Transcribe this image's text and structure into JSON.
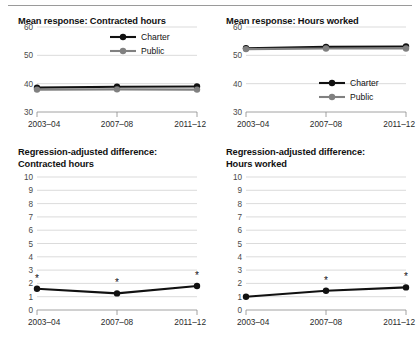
{
  "figure": {
    "background": "#ffffff",
    "charter_color": "#111111",
    "public_color": "#808080",
    "grid_color": "#d2d2d2",
    "axis_color": "#8c8c8c"
  },
  "legend": {
    "charter_label": "Charter",
    "public_label": "Public"
  },
  "panels": {
    "top_left": {
      "title": "Mean response: Contracted hours"
    },
    "top_right": {
      "title": "Mean response: Hours worked"
    },
    "bottom_left": {
      "title_line1": "Regression-adjusted difference:",
      "title_line2": "Contracted hours"
    },
    "bottom_right": {
      "title_line1": "Regression-adjusted difference:",
      "title_line2": "Hours worked"
    }
  },
  "chart_data": [
    {
      "id": "mean-response-contracted-hours",
      "type": "line",
      "title": "Mean response: Contracted hours",
      "xlabel": "",
      "ylabel": "",
      "categories": [
        "2003–04",
        "2007–08",
        "2011–12"
      ],
      "yticks": [
        30,
        40,
        50,
        60
      ],
      "ylim": [
        30,
        60
      ],
      "grid": true,
      "legend_position": "top-right",
      "series": [
        {
          "name": "Charter",
          "color": "#111111",
          "values": [
            38.6,
            38.9,
            39.0
          ]
        },
        {
          "name": "Public",
          "color": "#808080",
          "values": [
            37.9,
            38.0,
            37.9
          ]
        }
      ]
    },
    {
      "id": "mean-response-hours-worked",
      "type": "line",
      "title": "Mean response: Hours worked",
      "xlabel": "",
      "ylabel": "",
      "categories": [
        "2003–04",
        "2007–08",
        "2011–12"
      ],
      "yticks": [
        30,
        40,
        50,
        60
      ],
      "ylim": [
        30,
        60
      ],
      "grid": true,
      "legend_position": "bottom-right",
      "series": [
        {
          "name": "Charter",
          "color": "#111111",
          "values": [
            52.5,
            53.0,
            53.1
          ]
        },
        {
          "name": "Public",
          "color": "#808080",
          "values": [
            52.2,
            52.4,
            52.4
          ]
        }
      ]
    },
    {
      "id": "regression-adjusted-difference-contracted-hours",
      "type": "line",
      "title": "Regression-adjusted difference: Contracted hours",
      "xlabel": "",
      "ylabel": "",
      "categories": [
        "2003–04",
        "2007–08",
        "2011–12"
      ],
      "yticks": [
        0,
        1,
        2,
        3,
        4,
        5,
        6,
        7,
        8,
        9,
        10
      ],
      "ylim": [
        0,
        10
      ],
      "grid": true,
      "legend_position": "none",
      "series": [
        {
          "name": "Difference",
          "color": "#111111",
          "values": [
            1.6,
            1.25,
            1.8
          ]
        }
      ],
      "annotations": [
        {
          "x": "2003–04",
          "y": 1.6,
          "marker": "*",
          "meaning": "statistically significant"
        },
        {
          "x": "2007–08",
          "y": 1.25,
          "marker": "*",
          "meaning": "statistically significant"
        },
        {
          "x": "2011–12",
          "y": 1.8,
          "marker": "*",
          "meaning": "statistically significant"
        }
      ]
    },
    {
      "id": "regression-adjusted-difference-hours-worked",
      "type": "line",
      "title": "Regression-adjusted difference: Hours worked",
      "xlabel": "",
      "ylabel": "",
      "categories": [
        "2003–04",
        "2007–08",
        "2011–12"
      ],
      "yticks": [
        0,
        1,
        2,
        3,
        4,
        5,
        6,
        7,
        8,
        9,
        10
      ],
      "ylim": [
        0,
        10
      ],
      "grid": true,
      "legend_position": "none",
      "series": [
        {
          "name": "Difference",
          "color": "#111111",
          "values": [
            1.0,
            1.45,
            1.7
          ]
        }
      ],
      "annotations": [
        {
          "x": "2007–08",
          "y": 1.45,
          "marker": "*",
          "meaning": "statistically significant"
        },
        {
          "x": "2011–12",
          "y": 1.7,
          "marker": "*",
          "meaning": "statistically significant"
        }
      ]
    }
  ]
}
